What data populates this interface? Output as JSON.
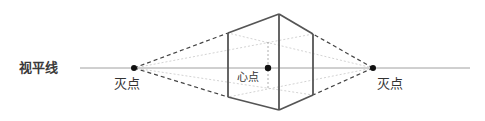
{
  "labels": {
    "horizon": "视平线",
    "vanishing_point_left": "灭点",
    "vanishing_point_right": "灭点",
    "center_point": "心点"
  },
  "colors": {
    "background": "#ffffff",
    "horizon_line": "#9a9a9a",
    "box_edges": "#555555",
    "dashed_lines": "#444444",
    "guide_lines": "#c8c8c8",
    "points": "#111111",
    "text": "#333333"
  },
  "geometry": {
    "horizon_y": 68,
    "horizon_x": [
      80,
      470
    ],
    "vanishing_point_left": [
      134,
      68
    ],
    "vanishing_point_right": [
      373,
      68
    ],
    "center_point": [
      268,
      68
    ],
    "box": {
      "left_edge": {
        "x": 228,
        "top": 33,
        "bottom": 97
      },
      "front_edge": {
        "x": 279,
        "top": 14,
        "bottom": 110
      },
      "right_edge": {
        "x": 313,
        "top": 34,
        "bottom": 95
      }
    }
  }
}
